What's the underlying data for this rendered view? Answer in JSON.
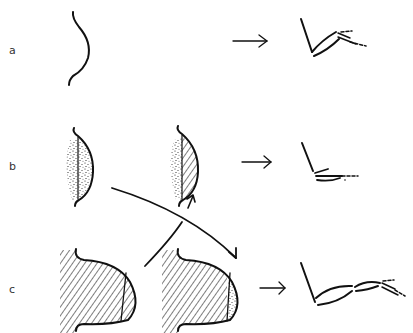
{
  "rows": [
    {
      "label": "a",
      "description": "simple curved outline transforms into articulated linkage"
    },
    {
      "label": "b",
      "description": "stippled lens shape, then stippled + hatched lens, transforms into folded linkage"
    },
    {
      "label": "c",
      "description": "hatched rounded shape with segment, then hatched + stippled shape, transforms into extended linkage"
    }
  ],
  "colors": {
    "ink": "#111111",
    "background": "#ffffff",
    "label": "#333333"
  },
  "icons": [
    "right-arrow-icon",
    "curved-arrow-icon"
  ]
}
